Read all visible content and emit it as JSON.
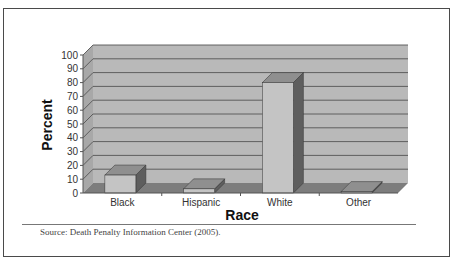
{
  "chart_data": {
    "type": "bar",
    "style": "3d-column",
    "title": "",
    "xlabel": "Race",
    "ylabel": "Percent",
    "categories": [
      "Black",
      "Hispanic",
      "White",
      "Other"
    ],
    "values": [
      13,
      3,
      80,
      1
    ],
    "ylim": [
      0,
      100
    ],
    "yticks": [
      0,
      10,
      20,
      30,
      40,
      50,
      60,
      70,
      80,
      90,
      100
    ],
    "grid": true,
    "legend": null
  },
  "source": "Source: Death Penalty Information Center (2005).",
  "colors": {
    "wall": "#b9b9b9",
    "side_wall": "#a8a8a8",
    "floor": "#7d7d7d",
    "grid": "#555555",
    "bar_front": "#c4c4c4",
    "bar_top": "#8f8f8f",
    "bar_side": "#5e5e5e"
  }
}
